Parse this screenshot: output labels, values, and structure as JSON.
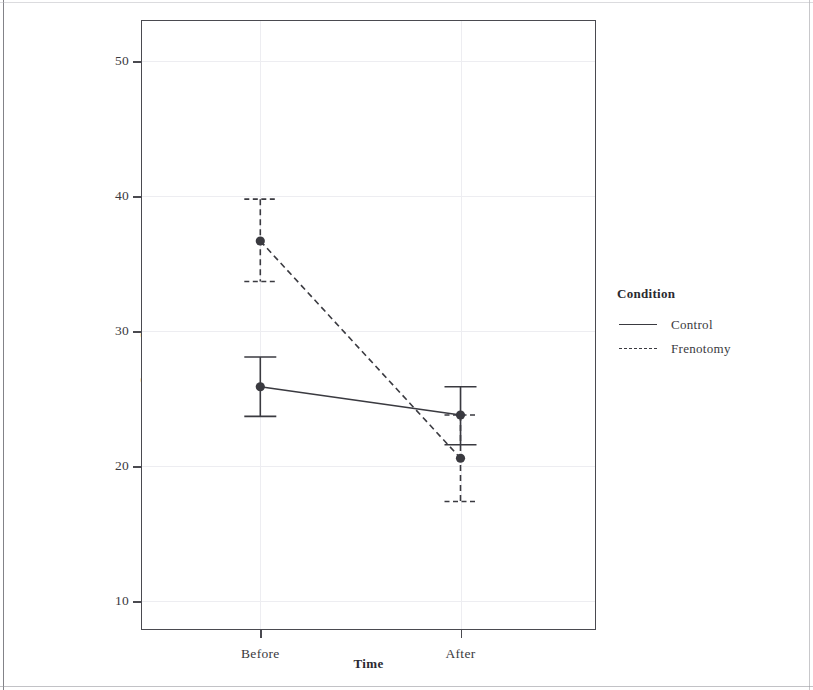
{
  "chart_data": {
    "type": "line",
    "title": "",
    "xlabel": "Time",
    "ylabel": "Survey Score",
    "categories": [
      "Before",
      "After"
    ],
    "ylim": [
      7.8,
      53.0
    ],
    "yticks": [
      10,
      20,
      30,
      40,
      50
    ],
    "ytick_labels": [
      "10",
      "20",
      "30",
      "40",
      "50"
    ],
    "grid": true,
    "legend": {
      "title": "Condition",
      "position": "right",
      "entries": [
        {
          "label": "Control",
          "linestyle": "solid"
        },
        {
          "label": "Frenotomy",
          "linestyle": "dashed"
        }
      ]
    },
    "series": [
      {
        "name": "Control",
        "linestyle": "solid",
        "color": "#3a3a40",
        "values": [
          25.9,
          23.8
        ],
        "error_low": [
          23.7,
          21.6
        ],
        "error_high": [
          28.1,
          25.9
        ]
      },
      {
        "name": "Frenotomy",
        "linestyle": "dashed",
        "color": "#3a3a40",
        "values": [
          36.7,
          20.6
        ],
        "error_low": [
          33.7,
          17.4
        ],
        "error_high": [
          39.8,
          23.8
        ]
      }
    ]
  },
  "axis": {
    "y_title": "Survey Score",
    "x_title": "Time",
    "y_tick_0": "10",
    "y_tick_1": "20",
    "y_tick_2": "30",
    "y_tick_3": "40",
    "y_tick_4": "50",
    "x_tick_0": "Before",
    "x_tick_1": "After"
  },
  "legend": {
    "title": "Condition",
    "item_0": "Control",
    "item_1": "Frenotomy"
  },
  "colors": {
    "ink": "#3a3a40",
    "panel_border": "#4a4a50",
    "grid": "#ededf1",
    "background": "#ffffff"
  }
}
